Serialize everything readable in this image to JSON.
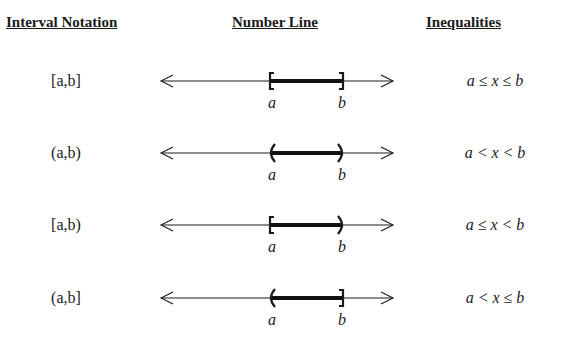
{
  "headers": {
    "interval_notation": "Interval Notation",
    "number_line": "Number Line",
    "inequalities": "Inequalities"
  },
  "rows": [
    {
      "notation": "[a,b]",
      "left_endpoint": "closed",
      "right_endpoint": "closed",
      "label_a": "a",
      "label_b": "b",
      "inequality": "a ≤ x ≤ b"
    },
    {
      "notation": "(a,b)",
      "left_endpoint": "open",
      "right_endpoint": "open",
      "label_a": "a",
      "label_b": "b",
      "inequality": "a < x < b"
    },
    {
      "notation": "[a,b)",
      "left_endpoint": "closed",
      "right_endpoint": "open",
      "label_a": "a",
      "label_b": "b",
      "inequality": "a ≤ x < b"
    },
    {
      "notation": "(a,b]",
      "left_endpoint": "open",
      "right_endpoint": "closed",
      "label_a": "a",
      "label_b": "b",
      "inequality": "a < x ≤ b"
    }
  ]
}
